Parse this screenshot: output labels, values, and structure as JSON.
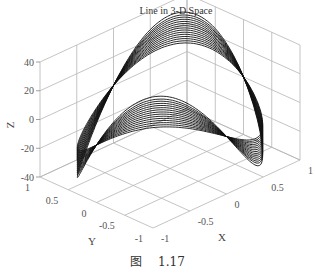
{
  "chart_data": {
    "type": "line",
    "subtype": "3d-line",
    "title": "Line in 3-D Space",
    "xlabel": "X",
    "ylabel": "Y",
    "zlabel": "Z",
    "xlim": [
      -1,
      1
    ],
    "ylim": [
      -1,
      1
    ],
    "zlim": [
      -40,
      40
    ],
    "xticks": [
      "-1",
      "-0.5",
      "0",
      "0.5",
      "1"
    ],
    "yticks": [
      "-1",
      "-0.5",
      "0",
      "0.5",
      "1"
    ],
    "zticks": [
      "-40",
      "-20",
      "0",
      "20",
      "40"
    ],
    "grid": true,
    "series_description": "Family of closed curves on unit cylinder: x=cos(t), y=sin(t), z=a*sin(2t)",
    "amplitudes": [
      18,
      19.5,
      21,
      22.5,
      24,
      25.5,
      27,
      28.5,
      30,
      31.5,
      33,
      34.5,
      36,
      37.5,
      39.5
    ],
    "line_color": "#111111"
  },
  "caption": {
    "label": "图",
    "number": "1.17"
  }
}
